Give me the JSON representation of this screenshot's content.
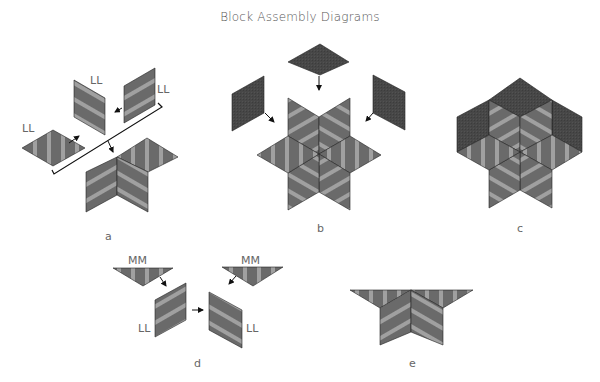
{
  "title": "Block Assembly Diagrams",
  "colors": {
    "stripe_dark": "#6a6a6a",
    "stripe_light": "#a0a0a0",
    "solid_dark": "#474747",
    "outline": "#222222",
    "text": "#666666"
  },
  "diagrams": [
    {
      "letter": "a",
      "piece_labels": [
        "LL",
        "LL",
        "LL"
      ]
    },
    {
      "letter": "b",
      "piece_labels": []
    },
    {
      "letter": "c",
      "piece_labels": []
    },
    {
      "letter": "d",
      "piece_labels": [
        "MM",
        "MM",
        "LL",
        "LL"
      ]
    },
    {
      "letter": "e",
      "piece_labels": []
    }
  ]
}
